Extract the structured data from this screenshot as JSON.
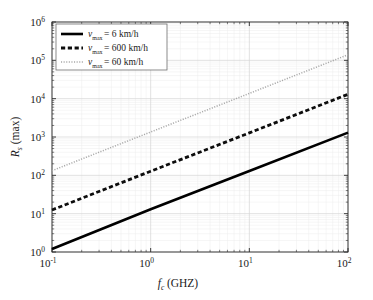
{
  "chart_data": {
    "type": "line",
    "title": "",
    "xlabel": "f_c (GHZ)",
    "xlabel_main": "f",
    "xlabel_sub": "c",
    "xlabel_unit": "(GHZ)",
    "ylabel": "R_s (max)",
    "ylabel_main": "R",
    "ylabel_sub": "s",
    "ylabel_unit": "(max)",
    "xscale": "log",
    "yscale": "log",
    "xlim": [
      0.1,
      100
    ],
    "ylim": [
      1,
      1000000
    ],
    "grid": true,
    "grid_minor": true,
    "legend_position": "upper left",
    "x_ticks": [
      {
        "value": 0.1,
        "mantissa": "10",
        "exponent": "-1"
      },
      {
        "value": 1,
        "mantissa": "10",
        "exponent": "0"
      },
      {
        "value": 10,
        "mantissa": "10",
        "exponent": "1"
      },
      {
        "value": 100,
        "mantissa": "10",
        "exponent": "2"
      }
    ],
    "y_ticks": [
      {
        "value": 1,
        "mantissa": "10",
        "exponent": "0"
      },
      {
        "value": 10,
        "mantissa": "10",
        "exponent": "1"
      },
      {
        "value": 100,
        "mantissa": "10",
        "exponent": "2"
      },
      {
        "value": 1000,
        "mantissa": "10",
        "exponent": "3"
      },
      {
        "value": 10000,
        "mantissa": "10",
        "exponent": "4"
      },
      {
        "value": 100000,
        "mantissa": "10",
        "exponent": "5"
      },
      {
        "value": 1000000,
        "mantissa": "10",
        "exponent": "6"
      }
    ],
    "series": [
      {
        "name": "v_max = 6 km/h",
        "legend_var": "v",
        "legend_sub": "max",
        "legend_rest": "= 6 km/h",
        "style": "solid",
        "color": "#000000",
        "width": 2.6,
        "x": [
          0.1,
          1,
          10,
          100
        ],
        "values": [
          1.2,
          13,
          130,
          1300
        ]
      },
      {
        "name": "v_max = 600 km/h",
        "legend_var": "v",
        "legend_sub": "max",
        "legend_rest": "= 600 km/h",
        "style": "dashed",
        "color": "#0d0d0d",
        "width": 2.8,
        "x": [
          0.1,
          1,
          10,
          100
        ],
        "values": [
          12.5,
          128,
          1280,
          13000
        ]
      },
      {
        "name": "v_max = 60 km/h",
        "legend_var": "v",
        "legend_sub": "max",
        "legend_rest": "= 60 km/h",
        "style": "dotted",
        "color": "#a8a8a8",
        "width": 1.5,
        "x": [
          0.1,
          1,
          10,
          100
        ],
        "values": [
          132,
          1350,
          13700,
          140000
        ]
      }
    ]
  },
  "colors": {
    "background": "#ffffff",
    "axis": "#2b2b2b",
    "grid_major": "#d6d6d6",
    "grid_minor": "#ededed",
    "legend_border": "#6e6e6e",
    "legend_bg": "#ffffff"
  }
}
